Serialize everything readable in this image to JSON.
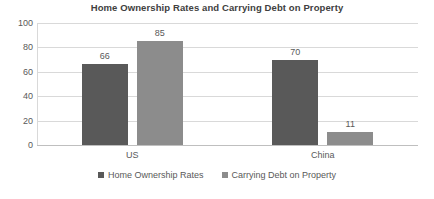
{
  "chart_data": {
    "type": "bar",
    "title": "Home Ownership Rates and Carrying Debt on Property",
    "xlabel": "",
    "ylabel": "",
    "categories": [
      "US",
      "China"
    ],
    "series": [
      {
        "name": "Home Ownership Rates",
        "color": "#595959",
        "values": [
          66,
          70
        ]
      },
      {
        "name": "Carrying Debt on Property",
        "color": "#8c8c8c",
        "values": [
          85,
          11
        ]
      }
    ],
    "bars": [
      {
        "category": "US",
        "series": "Home Ownership Rates",
        "value": 66,
        "label": "66",
        "color": "#595959"
      },
      {
        "category": "US",
        "series": "Carrying Debt on Property",
        "value": 70,
        "label": "70",
        "color": "#8c8c8c"
      },
      {
        "category": "China",
        "series": "Home Ownership Rates",
        "value": 85,
        "label": "85",
        "color": "#595959"
      },
      {
        "category": "China",
        "series": "Carrying Debt on Property",
        "value": 11,
        "label": "11",
        "color": "#8c8c8c"
      }
    ],
    "ylim": [
      0,
      100
    ],
    "yticks": [
      "100",
      "80",
      "60",
      "40",
      "20",
      "0"
    ],
    "ytick_values": [
      100,
      80,
      60,
      40,
      20,
      0
    ],
    "grid": true,
    "legend_position": "bottom",
    "legend": [
      "Home Ownership Rates",
      "Carrying Debt on Property"
    ],
    "background_color": "#ffffff",
    "text_color": "#595959",
    "gridline_color": "#d9d9d9"
  }
}
